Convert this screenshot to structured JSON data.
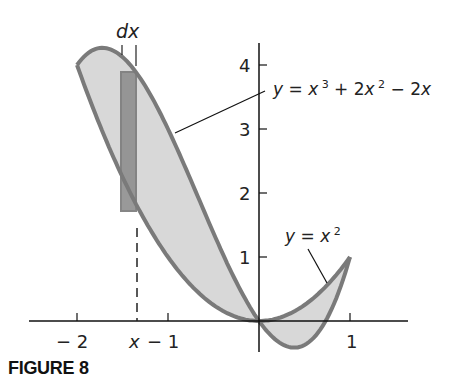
{
  "figure_label": "FIGURE 8",
  "labels": {
    "dx": "dx",
    "x_marker": "x",
    "cubic_eq_prefix": "y = x",
    "cubic_eq_full": "y = x³ + 2x² − 2x",
    "parabola_eq": "y = x²"
  },
  "axes": {
    "x_ticks": [
      {
        "value": -2,
        "label": "− 2"
      },
      {
        "value": -1,
        "label": "− 1"
      },
      {
        "value": 1,
        "label": "1"
      }
    ],
    "y_ticks": [
      {
        "value": 1,
        "label": "1"
      },
      {
        "value": 2,
        "label": "2"
      },
      {
        "value": 3,
        "label": "3"
      },
      {
        "value": 4,
        "label": "4"
      }
    ]
  },
  "colors": {
    "fill": "#d8d8d8",
    "curve": "#7a7a7a",
    "strip": "#8e8e8e",
    "axis": "#111111"
  },
  "chart_data": {
    "type": "line",
    "title": "FIGURE 8",
    "xlabel": "x",
    "ylabel": "y",
    "xlim": [
      -2.5,
      1.5
    ],
    "ylim": [
      -0.5,
      4.5
    ],
    "grid": false,
    "series": [
      {
        "name": "y = x³ + 2x² − 2x",
        "function": "x^3+2x^2-2x",
        "domain": [
          -2,
          1
        ]
      },
      {
        "name": "y = x²",
        "function": "x^2",
        "domain": [
          -2,
          1
        ]
      }
    ],
    "intersections": [
      [
        -2,
        4
      ],
      [
        0,
        0
      ],
      [
        1,
        1
      ]
    ],
    "shaded_region": "between curves from x=-2 to x=1",
    "strip": {
      "x": -1.45,
      "width_label": "dx",
      "x_label": "x"
    }
  }
}
